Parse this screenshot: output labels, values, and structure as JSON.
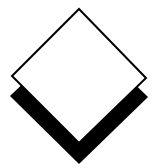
{
  "graphic": {
    "type": "layered-diamond-icon",
    "background_color": "#ffffff",
    "front_diamond": {
      "fill": "#ffffff",
      "stroke": "#000000",
      "points": "79,9 146,78 79,143 12,76"
    },
    "shadow_diamond": {
      "fill": "#000000",
      "points": "79,30 148,97 79,164 10,96"
    }
  }
}
